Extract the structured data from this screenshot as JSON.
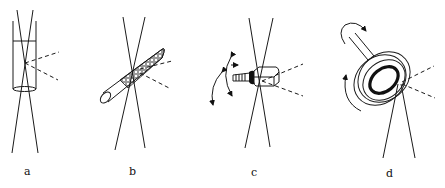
{
  "figure": {
    "panels": [
      {
        "id": "a",
        "label": "a",
        "description": "Sample in a cylindrical capillary tube intersected by the beam, scattered rays dashed"
      },
      {
        "id": "b",
        "label": "b",
        "description": "Packed powder in an inclined capillary intersected by the beam"
      },
      {
        "id": "c",
        "label": "c",
        "description": "Single crystal on a goniometer mount with rotation arrows"
      },
      {
        "id": "d",
        "label": "d",
        "description": "Ring sample holder on a rotating shaft, beam at grazing incidence"
      }
    ],
    "colors": {
      "line": "#1a1a1a",
      "background": "#ffffff"
    }
  }
}
